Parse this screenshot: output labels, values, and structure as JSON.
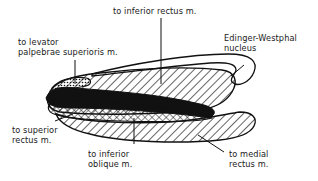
{
  "diagram": {
    "labels": {
      "inferior_rectus": "to inferior rectus m.",
      "levator_line1": "to levator",
      "levator_line2": "palpebrae superioris m.",
      "edinger_line1": "Edinger-Westphal",
      "edinger_line2": "nucleus",
      "superior_rectus_line1": "to superior",
      "superior_rectus_line2": "rectus m.",
      "inferior_oblique_line1": "to inferior",
      "inferior_oblique_line2": "oblique m.",
      "medial_rectus_line1": "to medial",
      "medial_rectus_line2": "rectus m."
    },
    "regions": [
      {
        "id": "inferior-rectus-subnucleus",
        "fill": "diagonal-hatch"
      },
      {
        "id": "levator-subnucleus",
        "fill": "dotted"
      },
      {
        "id": "edinger-westphal-nucleus",
        "fill": "outline"
      },
      {
        "id": "superior-rectus-subnucleus",
        "fill": "solid-black"
      },
      {
        "id": "inferior-oblique-subnucleus",
        "fill": "cross-hatch"
      },
      {
        "id": "medial-rectus-subnucleus",
        "fill": "diagonal-hatch"
      }
    ],
    "colors": {
      "ink": "#111111",
      "background": "#ffffff"
    }
  }
}
